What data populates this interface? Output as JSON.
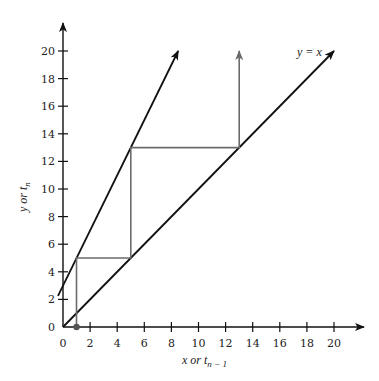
{
  "chart_data": {
    "type": "line",
    "title": "",
    "xlabel": "x or t_{n-1}",
    "ylabel": "y or t_n",
    "xlim": [
      0,
      21
    ],
    "ylim": [
      0,
      21
    ],
    "grid": false,
    "x_ticks": [
      0,
      2,
      4,
      6,
      8,
      10,
      12,
      14,
      16,
      18,
      20
    ],
    "y_ticks": [
      0,
      2,
      4,
      6,
      8,
      10,
      12,
      14,
      16,
      18,
      20
    ],
    "series": [
      {
        "name": "y = 2x + 3",
        "style": "black line with arrow",
        "points": [
          [
            -0.37,
            2.26
          ],
          [
            8.5,
            20.0
          ]
        ]
      },
      {
        "name": "y = x",
        "style": "black line with arrow",
        "label": "y = x",
        "points": [
          [
            0,
            0
          ],
          [
            20,
            20
          ]
        ]
      },
      {
        "name": "cobweb iteration",
        "style": "gray staircase with arrow",
        "points": [
          [
            1,
            0
          ],
          [
            1,
            5
          ],
          [
            5,
            5
          ],
          [
            5,
            13
          ],
          [
            13,
            13
          ],
          [
            13,
            20
          ]
        ]
      }
    ],
    "annotations": [
      {
        "type": "point",
        "x": 1,
        "y": 0,
        "description": "starting point t0 = 1"
      },
      {
        "type": "text",
        "text": "y = x",
        "x": 17.5,
        "y": 20
      }
    ]
  },
  "labels": {
    "xlabel_main": "x or t",
    "xlabel_sub": "n − 1",
    "ylabel_main": "y or t",
    "ylabel_sub": "n",
    "line_label": "y = x"
  },
  "colors": {
    "axis": "#111111",
    "lines": "#111111",
    "cobweb": "#6b6b6b"
  }
}
